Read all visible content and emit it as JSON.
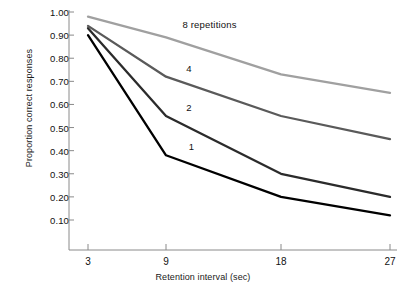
{
  "chart_data": {
    "type": "line",
    "title": "",
    "xlabel": "Retention interval  (sec)",
    "ylabel": "Proportion correct responses",
    "x": [
      3,
      9,
      18,
      27
    ],
    "xticklabels": [
      "3",
      "9",
      "18",
      "27"
    ],
    "yticks": [
      1.0,
      0.9,
      0.8,
      0.7,
      0.6,
      0.5,
      0.4,
      0.3,
      0.2,
      0.1
    ],
    "yticklabels": [
      "1.00",
      "0.90",
      "0.80",
      "0.70",
      "0.60",
      "0.50",
      "0.40",
      "0.30",
      "0.20",
      "0.10"
    ],
    "ylim": [
      0.05,
      1.0
    ],
    "xlim": [
      0,
      30
    ],
    "grid": false,
    "legend": "inline-annotations",
    "series": [
      {
        "name": "8 repetitions",
        "label": "8  repetitions",
        "color": "#a0a0a0",
        "values": [
          0.98,
          0.89,
          0.73,
          0.65
        ]
      },
      {
        "name": "4 repetitions",
        "label": "4",
        "color": "#5a5a5a",
        "values": [
          0.94,
          0.72,
          0.55,
          0.45
        ]
      },
      {
        "name": "2 repetitions",
        "label": "2",
        "color": "#2b2b2b",
        "values": [
          0.93,
          0.55,
          0.3,
          0.2
        ]
      },
      {
        "name": "1 repetition",
        "label": "1",
        "color": "#000000",
        "values": [
          0.9,
          0.38,
          0.2,
          0.12
        ]
      }
    ],
    "annotations": [
      {
        "text": "8  repetitions",
        "x": 10.5,
        "y": 0.945
      },
      {
        "text": "4",
        "x": 10.8,
        "y": 0.755
      },
      {
        "text": "2",
        "x": 10.8,
        "y": 0.585
      },
      {
        "text": "1",
        "x": 11.0,
        "y": 0.415
      }
    ],
    "axis_color": "#8a8a8a"
  }
}
